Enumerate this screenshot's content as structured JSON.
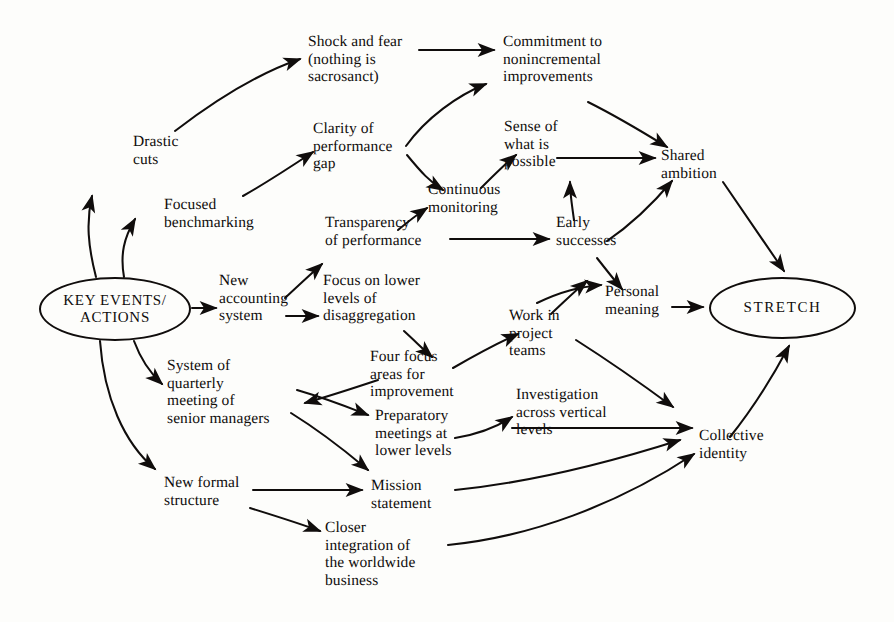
{
  "diagram": {
    "type": "causal-map",
    "ink_color": "#100d0c",
    "background_color": "#fdfdfb",
    "hubs": [
      {
        "id": "key_events",
        "label": "KEY EVENTS/\nACTIONS"
      },
      {
        "id": "stretch",
        "label": "STRETCH"
      }
    ],
    "nodes": [
      {
        "id": "shock_fear",
        "label": "Shock and fear\n(nothing is\nsacrosanct)"
      },
      {
        "id": "commitment",
        "label": "Commitment to\nnonincremental\nimprovements"
      },
      {
        "id": "clarity_gap",
        "label": "Clarity of\nperformance\ngap"
      },
      {
        "id": "sense_possible",
        "label": "Sense of\nwhat is\npossible"
      },
      {
        "id": "shared_ambition",
        "label": "Shared\nambition"
      },
      {
        "id": "drastic_cuts",
        "label": "Drastic\ncuts"
      },
      {
        "id": "focused_bench",
        "label": "Focused\nbenchmarking"
      },
      {
        "id": "continuous_mon",
        "label": "Continuous\nmonitoring"
      },
      {
        "id": "transparency",
        "label": "Transparency\nof performance"
      },
      {
        "id": "early_successes",
        "label": "Early\nsuccesses"
      },
      {
        "id": "new_accounting",
        "label": "New\naccounting\nsystem"
      },
      {
        "id": "focus_lower",
        "label": "Focus on lower\nlevels of\ndisaggregation"
      },
      {
        "id": "personal_meaning",
        "label": "Personal\nmeaning"
      },
      {
        "id": "work_project",
        "label": "Work in\nproject\nteams"
      },
      {
        "id": "system_quarterly",
        "label": "System of\nquarterly\nmeeting of\nsenior managers"
      },
      {
        "id": "four_focus",
        "label": "Four focus\nareas for\nimprovement"
      },
      {
        "id": "investigation",
        "label": "Investigation\nacross vertical\nlevels"
      },
      {
        "id": "preparatory",
        "label": "Preparatory\nmeetings at\nlower levels"
      },
      {
        "id": "collective_id",
        "label": "Collective\nidentity"
      },
      {
        "id": "new_formal",
        "label": "New formal\nstructure"
      },
      {
        "id": "mission",
        "label": "Mission\nstatement"
      },
      {
        "id": "closer_integ",
        "label": "Closer\nintegration of\nthe worldwide\nbusiness"
      }
    ],
    "edges": [
      {
        "from": "key_events",
        "to": "drastic_cuts"
      },
      {
        "from": "key_events",
        "to": "focused_bench"
      },
      {
        "from": "key_events",
        "to": "new_accounting"
      },
      {
        "from": "key_events",
        "to": "system_quarterly"
      },
      {
        "from": "key_events",
        "to": "new_formal"
      },
      {
        "from": "drastic_cuts",
        "to": "shock_fear"
      },
      {
        "from": "shock_fear",
        "to": "commitment"
      },
      {
        "from": "focused_bench",
        "to": "clarity_gap"
      },
      {
        "from": "clarity_gap",
        "to": "commitment"
      },
      {
        "from": "clarity_gap",
        "to": "continuous_mon"
      },
      {
        "from": "continuous_mon",
        "to": "sense_possible"
      },
      {
        "from": "sense_possible",
        "to": "shared_ambition"
      },
      {
        "from": "commitment",
        "to": "shared_ambition"
      },
      {
        "from": "new_accounting",
        "to": "transparency"
      },
      {
        "from": "new_accounting",
        "to": "focus_lower"
      },
      {
        "from": "transparency",
        "to": "continuous_mon"
      },
      {
        "from": "transparency",
        "to": "early_successes"
      },
      {
        "from": "early_successes",
        "to": "sense_possible"
      },
      {
        "from": "early_successes",
        "to": "shared_ambition"
      },
      {
        "from": "early_successes",
        "to": "personal_meaning"
      },
      {
        "from": "personal_meaning",
        "to": "stretch"
      },
      {
        "from": "shared_ambition",
        "to": "stretch"
      },
      {
        "from": "focus_lower",
        "to": "four_focus"
      },
      {
        "from": "four_focus",
        "to": "work_project"
      },
      {
        "from": "four_focus",
        "to": "system_quarterly"
      },
      {
        "from": "work_project",
        "to": "early_successes"
      },
      {
        "from": "work_project",
        "to": "personal_meaning"
      },
      {
        "from": "work_project",
        "to": "collective_id"
      },
      {
        "from": "system_quarterly",
        "to": "preparatory"
      },
      {
        "from": "system_quarterly",
        "to": "mission"
      },
      {
        "from": "preparatory",
        "to": "investigation"
      },
      {
        "from": "investigation",
        "to": "collective_id"
      },
      {
        "from": "new_formal",
        "to": "mission"
      },
      {
        "from": "new_formal",
        "to": "closer_integ"
      },
      {
        "from": "mission",
        "to": "collective_id"
      },
      {
        "from": "closer_integ",
        "to": "collective_id"
      },
      {
        "from": "collective_id",
        "to": "stretch"
      }
    ]
  }
}
